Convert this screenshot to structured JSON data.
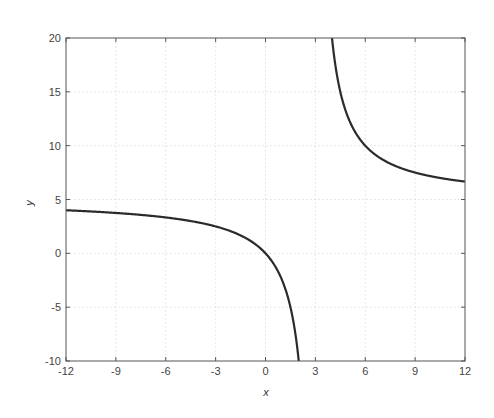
{
  "chart_data": {
    "type": "line",
    "title": "",
    "xlabel": "x",
    "ylabel": "y",
    "xlim": [
      -12,
      12
    ],
    "ylim": [
      -10,
      20
    ],
    "xticks": [
      -12,
      -9,
      -6,
      -3,
      0,
      3,
      6,
      9,
      12
    ],
    "yticks": [
      -10,
      -5,
      0,
      5,
      10,
      15,
      20
    ],
    "xtick_labels": [
      "-12",
      "-9",
      "-6",
      "-3",
      "0",
      "3",
      "6",
      "9",
      "12"
    ],
    "ytick_labels": [
      "-10",
      "-5",
      "0",
      "5",
      "10",
      "15",
      "20"
    ],
    "grid": true,
    "legend": null,
    "function": "y = 5 + 15/(x - 3)",
    "series": [
      {
        "name": "left branch",
        "color": "#2b2b2b",
        "x": [
          -12,
          -11,
          -10,
          -9,
          -8,
          -7,
          -6,
          -5,
          -4,
          -3,
          -2,
          -1,
          -0.5,
          0,
          0.5,
          1,
          1.25,
          1.5,
          1.75,
          2
        ],
        "y": [
          4.0,
          3.93,
          3.85,
          3.75,
          3.64,
          3.5,
          3.33,
          3.13,
          2.86,
          2.5,
          2.0,
          1.25,
          0.71,
          0.0,
          -1.0,
          -2.5,
          -3.57,
          -5.0,
          -7.0,
          -10.0
        ]
      },
      {
        "name": "right branch",
        "color": "#2b2b2b",
        "x": [
          4,
          4.25,
          4.5,
          4.75,
          5,
          5.5,
          6,
          6.5,
          7,
          8,
          9,
          10,
          11,
          12
        ],
        "y": [
          20.0,
          17.0,
          15.0,
          13.57,
          12.5,
          11.0,
          10.0,
          9.29,
          8.75,
          8.0,
          7.5,
          7.14,
          6.88,
          6.67
        ]
      }
    ]
  }
}
